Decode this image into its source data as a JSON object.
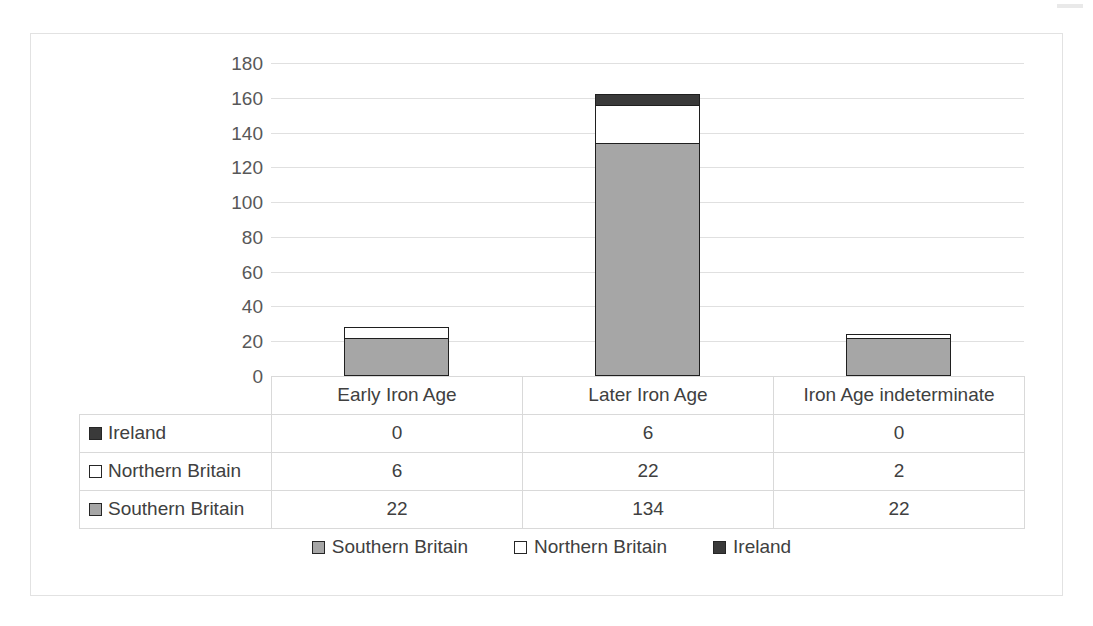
{
  "chart_data": {
    "type": "bar",
    "subtype": "stacked-column",
    "title": "",
    "xlabel": "",
    "ylabel": "",
    "ylim": [
      0,
      180
    ],
    "ytick_step": 20,
    "yticks": [
      180,
      160,
      140,
      120,
      100,
      80,
      60,
      40,
      20,
      0
    ],
    "grid": true,
    "legend_position": "bottom",
    "categories": [
      "Early Iron Age",
      "Later Iron Age",
      "Iron Age indeterminate"
    ],
    "series": [
      {
        "name": "Southern Britain",
        "values": [
          22,
          134,
          22
        ],
        "color": "#a6a6a6"
      },
      {
        "name": "Northern Britain",
        "values": [
          6,
          22,
          2
        ],
        "color": "#ffffff"
      },
      {
        "name": "Ireland",
        "values": [
          0,
          6,
          0
        ],
        "color": "#3a3a3a"
      }
    ],
    "stack_totals": [
      28,
      162,
      24
    ],
    "data_table": {
      "row_order": [
        "Ireland",
        "Northern Britain",
        "Southern Britain"
      ],
      "rows": [
        {
          "label": "Ireland",
          "swatch": "ireland",
          "values": [
            "0",
            "6",
            "0"
          ]
        },
        {
          "label": "Northern Britain",
          "swatch": "northern",
          "values": [
            "6",
            "22",
            "2"
          ]
        },
        {
          "label": "Southern Britain",
          "swatch": "southern",
          "values": [
            "22",
            "134",
            "22"
          ]
        }
      ]
    },
    "legend": [
      {
        "label": "Southern Britain",
        "swatch": "southern"
      },
      {
        "label": "Northern Britain",
        "swatch": "northern"
      },
      {
        "label": "Ireland",
        "swatch": "ireland"
      }
    ],
    "colors": {
      "southern_britain": "#a6a6a6",
      "northern_britain": "#ffffff",
      "ireland": "#3a3a3a",
      "bar_outline": "#1f1f1f",
      "gridline": "#e0e0e0",
      "table_border": "#d9d9d9",
      "frame_border": "#e2e2e2",
      "text": "#404040"
    }
  }
}
